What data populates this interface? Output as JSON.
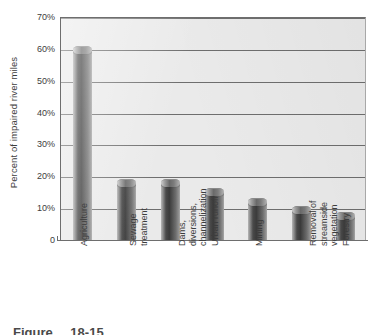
{
  "chart_data": {
    "type": "bar",
    "title": "",
    "subtitle": "",
    "xlabel": "",
    "ylabel": "Percent of impaired river miles",
    "ylim": [
      0,
      70
    ],
    "ytick_labels": [
      "70%",
      "60%",
      "50%",
      "40%",
      "30%",
      "20%",
      "10%",
      "0"
    ],
    "ytick_values": [
      70,
      60,
      50,
      40,
      30,
      20,
      10,
      0
    ],
    "grid": true,
    "grid_axis": "y",
    "legend": null,
    "categories": [
      "Agriculture",
      "Sewage treatment",
      "Dams, diversions, channelization",
      "Urban runoff",
      "Mining",
      "Removal of streamside vegetation",
      "Forestry"
    ],
    "category_lines": [
      [
        "Agriculture"
      ],
      [
        "Sewage",
        "treatment"
      ],
      [
        "Dams,",
        "diversions,",
        "channelization"
      ],
      [
        "Urban runoff"
      ],
      [
        "Mining"
      ],
      [
        "Removal of",
        "streamside",
        "vegetation"
      ],
      [
        "Forestry"
      ]
    ],
    "values": [
      59.5,
      18,
      18,
      15,
      12,
      9.5,
      7.5
    ],
    "value_unit": "%",
    "bar_style": "cylinder",
    "bar_color": "#4a4a4a",
    "plot_background": "#eaeaea",
    "grid_color": "#6e6e6e",
    "axis_color": "#6e6e6e"
  },
  "caption": {
    "label": "Figure",
    "number": "18-15"
  }
}
